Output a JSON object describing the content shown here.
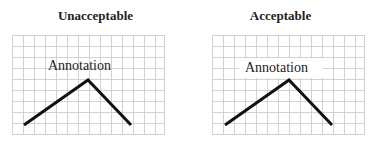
{
  "panels": [
    {
      "title": "Unacceptable",
      "annotation": "Annotation",
      "annotation_has_background": false
    },
    {
      "title": "Acceptable",
      "annotation": "Annotation",
      "annotation_has_background": true
    }
  ],
  "colors": {
    "grid": "#c8c8c8",
    "line": "#111111",
    "text": "#222222",
    "background": "#ffffff"
  }
}
